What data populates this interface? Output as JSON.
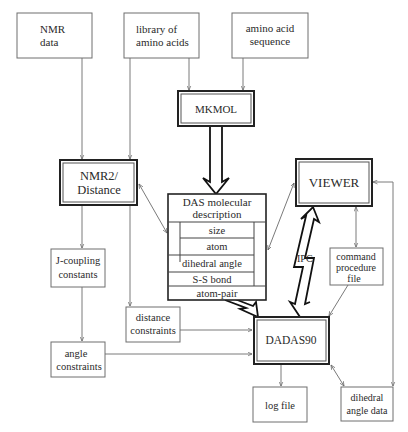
{
  "diagram": {
    "nodes": {
      "nmr_data": {
        "lines": [
          "NMR",
          "data"
        ]
      },
      "library": {
        "lines": [
          "library of",
          "amino acids"
        ]
      },
      "sequence": {
        "lines": [
          "amino acid",
          "sequence"
        ]
      },
      "mkmol": {
        "label": "MKMOL"
      },
      "nmr2": {
        "lines": [
          "NMR2/",
          "Distance"
        ]
      },
      "das": {
        "title_lines": [
          "DAS molecular",
          "description"
        ],
        "rows": [
          "size",
          "atom",
          "dihedral angle",
          "S-S bond",
          "atom-pair"
        ]
      },
      "viewer": {
        "label": "VIEWER"
      },
      "jcoupling": {
        "lines": [
          "J-coupling",
          "constants"
        ]
      },
      "distance_constraints": {
        "lines": [
          "distance",
          "constraints"
        ]
      },
      "command_file": {
        "lines": [
          "command",
          "procedure",
          "file"
        ]
      },
      "dadas90": {
        "label": "DADAS90"
      },
      "angle_constraints": {
        "lines": [
          "angle",
          "constraints"
        ]
      },
      "log_file": {
        "label": "log file"
      },
      "dihedral_data": {
        "lines": [
          "dihedral",
          "angle data"
        ]
      }
    },
    "ipc_label": "IPC",
    "edges": [
      {
        "from": "NMR data",
        "to": "NMR2/Distance",
        "style": "thin-arrow"
      },
      {
        "from": "library of amino acids",
        "to": "NMR2/Distance",
        "style": "thin-arrow"
      },
      {
        "from": "library of amino acids",
        "to": "MKMOL",
        "style": "thin-arrow"
      },
      {
        "from": "amino acid sequence",
        "to": "MKMOL",
        "style": "thin-arrow"
      },
      {
        "from": "MKMOL",
        "to": "DAS molecular description",
        "style": "thick-arrow"
      },
      {
        "from": "NMR2/Distance",
        "to": "DAS molecular description",
        "style": "thin-bidirectional"
      },
      {
        "from": "VIEWER",
        "to": "DAS molecular description",
        "style": "thin-bidirectional"
      },
      {
        "from": "NMR2/Distance",
        "to": "J-coupling constants",
        "style": "thin-arrow"
      },
      {
        "from": "library of amino acids",
        "to": "distance constraints",
        "style": "thin-arrow"
      },
      {
        "from": "J-coupling constants",
        "to": "angle constraints",
        "style": "thin-arrow"
      },
      {
        "from": "distance constraints",
        "to": "DADAS90",
        "style": "thin-arrow"
      },
      {
        "from": "angle constraints",
        "to": "DADAS90",
        "style": "thin-arrow"
      },
      {
        "from": "DAS molecular description",
        "to": "DADAS90",
        "style": "thick-arrow"
      },
      {
        "from": "VIEWER",
        "to": "DADAS90",
        "style": "ipc-bolt-bidirectional"
      },
      {
        "from": "VIEWER",
        "to": "command procedure file",
        "style": "thin-bidirectional"
      },
      {
        "from": "command procedure file",
        "to": "DADAS90",
        "style": "thin-arrow"
      },
      {
        "from": "DADAS90",
        "to": "log file",
        "style": "thin-arrow"
      },
      {
        "from": "DADAS90",
        "to": "dihedral angle data",
        "style": "thin-bidirectional"
      },
      {
        "from": "VIEWER",
        "to": "dihedral angle data",
        "style": "thin-bidirectional"
      }
    ]
  }
}
